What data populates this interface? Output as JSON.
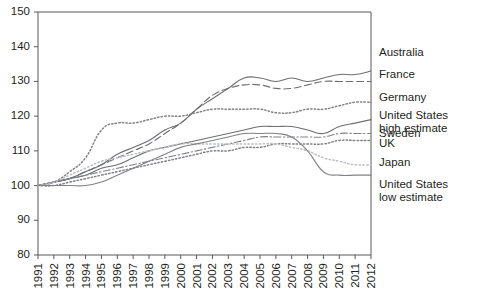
{
  "chart_data": {
    "type": "line",
    "title": "",
    "subtitle": "",
    "xlabel": "",
    "ylabel": "",
    "grid": false,
    "legend_position": "right-inline",
    "x": [
      1991,
      1992,
      1993,
      1994,
      1995,
      1996,
      1997,
      1998,
      1999,
      2000,
      2001,
      2002,
      2003,
      2004,
      2005,
      2006,
      2007,
      2008,
      2009,
      2010,
      2011,
      2012
    ],
    "xlim": [
      1991,
      2012
    ],
    "ylim": [
      80,
      150
    ],
    "yticks": [
      80,
      90,
      100,
      110,
      120,
      130,
      140,
      150
    ],
    "xticks": [
      "1991",
      "1992",
      "1993",
      "1994",
      "1995",
      "1996",
      "1997",
      "1998",
      "1999",
      "2000",
      "2001",
      "2002",
      "2003",
      "2004",
      "2005",
      "2006",
      "2007",
      "2008",
      "2009",
      "2010",
      "2011",
      "2012"
    ],
    "series": [
      {
        "name": "Australia",
        "style": "solid",
        "color": "#6d6e71",
        "label_value": 133,
        "values": [
          100,
          101,
          102,
          104,
          106,
          109,
          111,
          113,
          116,
          118,
          122,
          125,
          128,
          131,
          131,
          130,
          131,
          130,
          131,
          132,
          132,
          133
        ]
      },
      {
        "name": "France",
        "style": "dashed",
        "color": "#6d6e71",
        "label_value": 130,
        "values": [
          100,
          101,
          102,
          104,
          106,
          108,
          110,
          112,
          115,
          118,
          122,
          126,
          128,
          129,
          129,
          128,
          128,
          129,
          130,
          130,
          130,
          130
        ]
      },
      {
        "name": "Germany",
        "style": "dotted",
        "color": "#808285",
        "label_value": 124,
        "values": [
          100,
          101,
          104,
          108,
          116,
          118,
          118,
          119,
          120,
          120,
          121,
          122,
          122,
          122,
          122,
          121,
          121,
          122,
          122,
          123,
          124,
          124
        ]
      },
      {
        "name": "United States high estimate",
        "style": "solid",
        "color": "#6d6e71",
        "label_value": 119,
        "values": [
          100,
          101,
          102,
          103,
          105,
          106,
          108,
          110,
          111,
          112,
          113,
          114,
          115,
          116,
          117,
          117,
          117,
          116,
          115,
          117,
          118,
          119
        ]
      },
      {
        "name": "Sweden",
        "style": "dashdot",
        "color": "#808285",
        "label_value": 115,
        "values": [
          100,
          101,
          102,
          103,
          104,
          105,
          106,
          107,
          108,
          109,
          110,
          111,
          112,
          113,
          114,
          114,
          114,
          114,
          114,
          115,
          115,
          115
        ]
      },
      {
        "name": "UK",
        "style": "dotted",
        "color": "#808285",
        "label_value": 113,
        "values": [
          100,
          100,
          101,
          102,
          103,
          104,
          105,
          106,
          107,
          108,
          109,
          110,
          110,
          111,
          111,
          112,
          112,
          112,
          112,
          113,
          113,
          113
        ]
      },
      {
        "name": "Japan",
        "style": "dotted-light",
        "color": "#bcbec0",
        "label_value": 106,
        "values": [
          100,
          101,
          103,
          105,
          107,
          108,
          109,
          110,
          111,
          112,
          112,
          112,
          112,
          112,
          112,
          112,
          111,
          110,
          108,
          107,
          106,
          106
        ]
      },
      {
        "name": "United States low estimate",
        "style": "solid",
        "color": "#808285",
        "label_value": 103,
        "values": [
          100,
          100,
          100,
          100,
          101,
          103,
          105,
          107,
          109,
          111,
          112,
          113,
          114,
          115,
          115,
          115,
          114,
          110,
          104,
          103,
          103,
          103
        ]
      }
    ],
    "annotations": [
      {
        "text": "Australia",
        "anchor_year": 2012,
        "anchor_value": 133,
        "dx": 8,
        "dy": -18
      },
      {
        "text": "France",
        "anchor_year": 2012,
        "anchor_value": 130,
        "dx": 8,
        "dy": -6
      },
      {
        "text": "Germany",
        "anchor_year": 2012,
        "anchor_value": 124,
        "dx": 8,
        "dy": -4
      },
      {
        "text": "United States",
        "anchor_year": 2012,
        "anchor_value": 119,
        "dx": 8,
        "dy": -4
      },
      {
        "text": "high estimate",
        "anchor_year": 2012,
        "anchor_value": 119,
        "dx": 8,
        "dy": 9
      },
      {
        "text": "Sweden",
        "anchor_year": 2012,
        "anchor_value": 115,
        "dx": 8,
        "dy": 0
      },
      {
        "text": "UK",
        "anchor_year": 2012,
        "anchor_value": 113,
        "dx": 8,
        "dy": 4
      },
      {
        "text": "Japan",
        "anchor_year": 2012,
        "anchor_value": 106,
        "dx": 8,
        "dy": -2
      },
      {
        "text": "United States",
        "anchor_year": 2012,
        "anchor_value": 103,
        "dx": 8,
        "dy": 10
      },
      {
        "text": "low estimate",
        "anchor_year": 2012,
        "anchor_value": 103,
        "dx": 8,
        "dy": 23
      }
    ]
  },
  "legend_labels": {
    "australia": "Australia",
    "france": "France",
    "germany": "Germany",
    "us_high_line1": "United States",
    "us_high_line2": "high estimate",
    "sweden": "Sweden",
    "uk": "UK",
    "japan": "Japan",
    "us_low_line1": "United States",
    "us_low_line2": "low estimate"
  }
}
